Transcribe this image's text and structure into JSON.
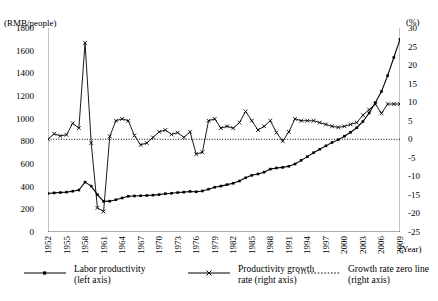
{
  "chart_data": {
    "type": "line",
    "title": "",
    "xlabel": "(Year)",
    "ylabel_left": "(RMB/people)",
    "ylabel_right": "(%)",
    "grid": false,
    "legend_position": "bottom",
    "ylim_left": [
      0,
      1800
    ],
    "ylim_right": [
      -25,
      30
    ],
    "yticks_left": [
      1800,
      1600,
      1400,
      1200,
      1000,
      800,
      600,
      400,
      200,
      0
    ],
    "yticks_right": [
      30,
      25,
      20,
      15,
      10,
      5,
      0,
      -5,
      -10,
      -15,
      -20,
      -25
    ],
    "x": [
      1952,
      1953,
      1954,
      1955,
      1956,
      1957,
      1958,
      1959,
      1960,
      1961,
      1962,
      1963,
      1964,
      1965,
      1966,
      1967,
      1968,
      1969,
      1970,
      1971,
      1972,
      1973,
      1974,
      1975,
      1976,
      1977,
      1978,
      1979,
      1980,
      1981,
      1982,
      1983,
      1984,
      1985,
      1986,
      1987,
      1988,
      1989,
      1990,
      1991,
      1992,
      1993,
      1994,
      1995,
      1996,
      1997,
      1998,
      1999,
      2000,
      2001,
      2002,
      2003,
      2004,
      2005,
      2006,
      2007,
      2008,
      2009
    ],
    "xticks": [
      1952,
      1955,
      1958,
      1961,
      1964,
      1967,
      1970,
      1973,
      1976,
      1979,
      1982,
      1985,
      1988,
      1991,
      1994,
      1997,
      2000,
      2003,
      2006,
      2009
    ],
    "xtick_labels": [
      "1952",
      "1955",
      "1958",
      "1961",
      "1964",
      "1967",
      "1970",
      "1973",
      "1976",
      "1979",
      "1982",
      "1985",
      "1988",
      "1991",
      "1994",
      "1997",
      "2000",
      "2003",
      "2006",
      "2009"
    ],
    "series": [
      {
        "name": "Labor productivity (left axis)",
        "axis": "left",
        "unit": "RMB/people",
        "marker": "square",
        "linestyle": "solid",
        "color": "#000000",
        "values": [
          340,
          345,
          348,
          352,
          360,
          370,
          440,
          405,
          330,
          270,
          272,
          285,
          300,
          315,
          318,
          320,
          322,
          325,
          330,
          338,
          342,
          348,
          352,
          358,
          355,
          362,
          378,
          395,
          405,
          418,
          430,
          450,
          478,
          500,
          512,
          528,
          555,
          565,
          570,
          580,
          600,
          632,
          665,
          700,
          730,
          760,
          790,
          815,
          845,
          880,
          920,
          975,
          1050,
          1140,
          1240,
          1380,
          1540,
          1700
        ]
      },
      {
        "name": "Productivity growth rate (right axis)",
        "axis": "right",
        "unit": "%",
        "marker": "x",
        "linestyle": "solid",
        "color": "#000000",
        "values": [
          0,
          1.5,
          0.9,
          1.2,
          4.3,
          3.0,
          26.0,
          -1.0,
          -18.5,
          -19.5,
          0.8,
          5.0,
          5.5,
          5.0,
          1.0,
          -1.5,
          -1.0,
          0.5,
          2.0,
          2.5,
          1.3,
          1.8,
          0.5,
          2.0,
          -4.0,
          -3.5,
          5.0,
          5.5,
          3.0,
          3.5,
          3.0,
          4.5,
          7.5,
          5.0,
          2.5,
          3.5,
          5.0,
          1.8,
          -0.5,
          2.0,
          5.5,
          5.0,
          5.0,
          5.0,
          4.5,
          4.0,
          3.5,
          3.2,
          3.5,
          4.0,
          4.5,
          6.5,
          8.0,
          9.5,
          7.0,
          9.5,
          9.5,
          9.5
        ]
      },
      {
        "name": "Growth rate zero line (right axis)",
        "axis": "right",
        "marker": "none",
        "linestyle": "dotted",
        "color": "#000000",
        "value": 0
      }
    ]
  },
  "legend": [
    {
      "label_line1": "Labor productivity",
      "label_line2": "(left axis)",
      "symbol": "line-square"
    },
    {
      "label_line1": "Productivity growth",
      "label_line2": "rate (right axis)",
      "symbol": "line-x"
    },
    {
      "label_line1": "Growth rate zero line",
      "label_line2": "(right axis)",
      "symbol": "line-dotted"
    }
  ]
}
